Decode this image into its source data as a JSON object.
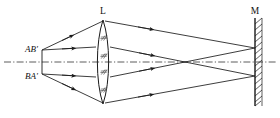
{
  "figure": {
    "background_color": "#ffffff",
    "line_color": "#1a1a1a",
    "axis_color": "#333333",
    "labels": {
      "lens": "L",
      "mirror": "M",
      "object_top": "AB'",
      "object_bottom": "BA'"
    },
    "elements": {
      "lens": {
        "name": "converging-lens",
        "type": "biconvex",
        "center_x": 103,
        "top_y": 20,
        "bottom_y": 104,
        "half_width": 8,
        "hatch_marks": 4,
        "hatch_symbol": "//"
      },
      "mirror": {
        "name": "plane-mirror",
        "x": 255,
        "top_y": 18,
        "bottom_y": 106,
        "hatch_side": "right",
        "hatch_count": 14
      },
      "optical_axis": {
        "name": "optical-axis",
        "y": 62,
        "x_start": 4,
        "x_end": 276,
        "style": "dash-dot"
      },
      "object": {
        "name": "object-arrow",
        "x": 42,
        "top_y": 50,
        "bottom_y": 74
      },
      "focal_point": {
        "x": 185,
        "y": 62
      },
      "mirror_focus_top": {
        "x": 255,
        "y": 48
      },
      "mirror_focus_bottom": {
        "x": 255,
        "y": 76
      }
    },
    "label_positions": {
      "lens": {
        "x": 103,
        "y": 15
      },
      "mirror": {
        "x": 255,
        "y": 14
      },
      "object_top": {
        "x": 20,
        "y": 52
      },
      "object_bottom": {
        "x": 20,
        "y": 79
      }
    }
  }
}
